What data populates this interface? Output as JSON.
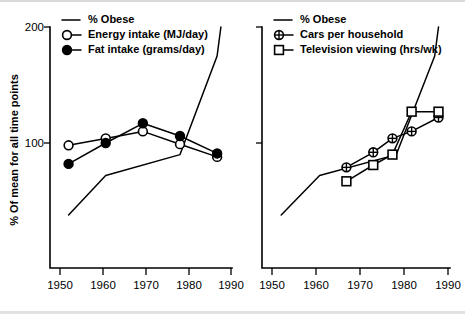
{
  "figure": {
    "background": "#ffffff",
    "line_color": "#000000",
    "y_axis_title": "% Of mean for all time points",
    "y_ticks": [
      100,
      200
    ],
    "y_range": [
      0,
      210
    ],
    "x_ticks": [
      1950,
      1960,
      1970,
      1980,
      1990
    ],
    "x_range": [
      1945,
      1994
    ]
  },
  "chart_data": [
    {
      "type": "line",
      "panel": "left",
      "title": "",
      "xlabel": "",
      "ylabel": "% Of mean for all time points",
      "ylim": [
        0,
        210
      ],
      "xlim": [
        1945,
        1994
      ],
      "yticks": [
        100,
        200
      ],
      "xticks": [
        1950,
        1960,
        1970,
        1980,
        1990
      ],
      "grid": false,
      "legend_position": "top-left",
      "series": [
        {
          "name": "% Obese",
          "marker": "none",
          "x": [
            1950,
            1960,
            1980,
            1990,
            1991
          ],
          "values": [
            38,
            72,
            90,
            175,
            200
          ]
        },
        {
          "name": "Energy intake (MJ/day)",
          "marker": "open-circle",
          "x": [
            1950,
            1960,
            1970,
            1980,
            1990
          ],
          "values": [
            98,
            104,
            110,
            99,
            88
          ]
        },
        {
          "name": "Fat intake (grams/day)",
          "marker": "filled-circle",
          "x": [
            1950,
            1960,
            1970,
            1980,
            1990
          ],
          "values": [
            82,
            100,
            117,
            106,
            91
          ]
        }
      ]
    },
    {
      "type": "line",
      "panel": "right",
      "title": "",
      "xlabel": "",
      "ylabel": "",
      "ylim": [
        0,
        210
      ],
      "xlim": [
        1945,
        1994
      ],
      "yticks": [
        100,
        200
      ],
      "xticks": [
        1950,
        1960,
        1970,
        1980,
        1990
      ],
      "grid": false,
      "legend_position": "top-left",
      "series": [
        {
          "name": "% Obese",
          "marker": "none",
          "x": [
            1950,
            1960,
            1980,
            1990,
            1991
          ],
          "values": [
            38,
            72,
            90,
            175,
            200
          ]
        },
        {
          "name": "Cars per household",
          "marker": "circle-cross",
          "x": [
            1967,
            1974,
            1979,
            1984,
            1991
          ],
          "values": [
            79,
            92,
            104,
            110,
            122
          ]
        },
        {
          "name": "Television viewing (hrs/wk)",
          "marker": "open-square",
          "x": [
            1967,
            1974,
            1979,
            1984,
            1991
          ],
          "values": [
            67,
            81,
            90,
            127,
            127
          ]
        }
      ]
    }
  ],
  "legends": {
    "left": [
      {
        "label": "% Obese",
        "marker": "line"
      },
      {
        "label": "Energy intake (MJ/day)",
        "marker": "open-circle"
      },
      {
        "label": "Fat intake (grams/day)",
        "marker": "filled-circle"
      }
    ],
    "right": [
      {
        "label": "% Obese",
        "marker": "line"
      },
      {
        "label": "Cars per household",
        "marker": "circle-cross"
      },
      {
        "label": "Television viewing (hrs/wk)",
        "marker": "open-square"
      }
    ]
  },
  "ticklabels": {
    "y": [
      "200",
      "100"
    ],
    "x_left": [
      "1950",
      "1960",
      "1970",
      "1980",
      "1990"
    ],
    "x_right": [
      "1950",
      "1960",
      "1970",
      "1980",
      "1990"
    ]
  }
}
